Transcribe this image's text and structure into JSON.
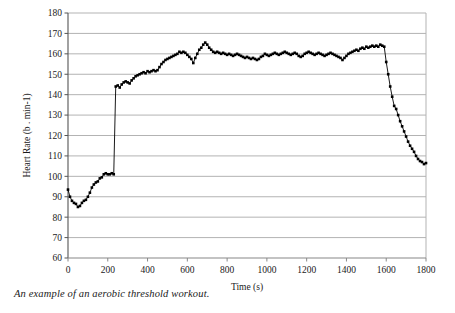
{
  "caption": "An example of an aerobic threshold workout.",
  "chart_data": {
    "type": "line",
    "title": "",
    "xlabel": "Time (s)",
    "ylabel": "Heart Rate (b . min-1)",
    "xlim": [
      0,
      1800
    ],
    "ylim": [
      60,
      180
    ],
    "xticks": [
      0,
      200,
      400,
      600,
      800,
      1000,
      1200,
      1400,
      1600,
      1800
    ],
    "yticks": [
      60,
      70,
      80,
      90,
      100,
      110,
      120,
      130,
      140,
      150,
      160,
      170,
      180
    ],
    "grid": "horizontal",
    "legend": "none",
    "marker": "square",
    "marker_color": "#000000",
    "line_color": "#000000",
    "grid_color": "#b3b3b3",
    "axis_color": "#808080",
    "x": [
      0,
      10,
      20,
      30,
      40,
      50,
      60,
      70,
      80,
      90,
      100,
      110,
      120,
      130,
      140,
      150,
      160,
      170,
      180,
      190,
      200,
      210,
      220,
      230,
      240,
      250,
      260,
      270,
      280,
      290,
      300,
      310,
      320,
      330,
      340,
      350,
      360,
      370,
      380,
      390,
      400,
      410,
      420,
      430,
      440,
      450,
      460,
      470,
      480,
      490,
      500,
      510,
      520,
      530,
      540,
      550,
      560,
      570,
      580,
      590,
      600,
      610,
      620,
      630,
      640,
      650,
      660,
      670,
      680,
      690,
      700,
      710,
      720,
      730,
      740,
      750,
      760,
      770,
      780,
      790,
      800,
      810,
      820,
      830,
      840,
      850,
      860,
      870,
      880,
      890,
      900,
      910,
      920,
      930,
      940,
      950,
      960,
      970,
      980,
      990,
      1000,
      1010,
      1020,
      1030,
      1040,
      1050,
      1060,
      1070,
      1080,
      1090,
      1100,
      1110,
      1120,
      1130,
      1140,
      1150,
      1160,
      1170,
      1180,
      1190,
      1200,
      1210,
      1220,
      1230,
      1240,
      1250,
      1260,
      1270,
      1280,
      1290,
      1300,
      1310,
      1320,
      1330,
      1340,
      1350,
      1360,
      1370,
      1380,
      1390,
      1400,
      1410,
      1420,
      1430,
      1440,
      1450,
      1460,
      1470,
      1480,
      1490,
      1500,
      1510,
      1520,
      1530,
      1540,
      1550,
      1560,
      1570,
      1580,
      1590,
      1600,
      1610,
      1620,
      1630,
      1640,
      1650,
      1660,
      1670,
      1680,
      1690,
      1700,
      1710,
      1720,
      1730,
      1740,
      1750,
      1760,
      1770,
      1780,
      1790,
      1800
    ],
    "y": [
      93.5,
      90,
      88,
      87,
      86.5,
      85,
      85.5,
      87,
      88,
      88.5,
      90,
      92,
      94.5,
      96,
      97,
      97.5,
      99,
      99.5,
      101,
      101.5,
      101,
      101,
      101.5,
      101,
      144,
      144.5,
      143.5,
      145,
      146,
      146.5,
      146,
      145.5,
      147,
      148,
      149,
      149.5,
      150,
      150.5,
      151,
      150.5,
      151.5,
      151,
      151.5,
      152,
      151.5,
      152,
      153.5,
      155,
      156,
      157,
      157.5,
      158,
      158.5,
      159,
      159.5,
      160,
      161,
      160.5,
      161,
      160.5,
      159.5,
      158.5,
      157.5,
      155.5,
      158,
      160,
      162,
      163,
      164.5,
      165.5,
      164.5,
      163,
      162,
      161,
      160.5,
      161,
      160.5,
      160,
      160.5,
      160,
      159.5,
      160,
      159.5,
      159,
      159.5,
      160,
      159.5,
      159,
      158.5,
      158,
      158.5,
      158,
      157.5,
      158,
      157.5,
      157,
      157.5,
      158.5,
      159,
      160,
      159.5,
      159,
      159.5,
      160,
      160.5,
      160,
      159.5,
      160,
      160.5,
      161,
      160.5,
      160,
      159.5,
      160,
      160.5,
      160,
      159,
      158.5,
      159,
      160,
      160.5,
      161,
      160.5,
      160,
      159.5,
      160,
      160.5,
      160,
      159.5,
      159,
      159.5,
      160,
      160.5,
      160,
      159.5,
      159,
      158.5,
      158,
      157,
      158,
      159,
      160,
      160.5,
      161,
      161.5,
      162,
      161.5,
      162.5,
      163,
      162.5,
      163.5,
      163,
      163.5,
      164,
      163.5,
      164,
      163.5,
      164.5,
      164,
      163.5,
      156,
      150,
      144,
      139,
      134.5,
      133,
      130,
      127,
      124.5,
      122,
      119.5,
      117,
      115,
      113.5,
      112,
      110,
      108.5,
      107.5,
      107,
      106,
      106.5,
      108,
      110.5,
      111
    ]
  }
}
